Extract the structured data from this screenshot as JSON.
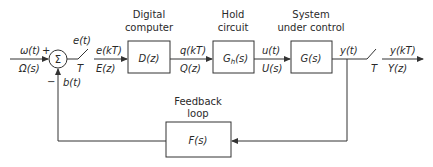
{
  "diagram": {
    "type": "block-diagram",
    "input": {
      "time": "ω(t)",
      "laplace": "Ω(s)",
      "sign": "+"
    },
    "summing_junction": {
      "symbol": "Σ",
      "feedback_sign": "−"
    },
    "sampler_in": {
      "signal_above": "e(t)",
      "period": "T",
      "out_time": "e(kT)",
      "out_z": "E(z)"
    },
    "blocks": [
      {
        "id": "digital-computer",
        "caption_line1": "Digital",
        "caption_line2": "computer",
        "tf": "D(z)"
      },
      {
        "id": "hold-circuit",
        "caption_line1": "Hold",
        "caption_line2": "circuit",
        "tf": "Gh(s)",
        "tf_main": "G",
        "tf_sub": "h",
        "tf_arg": "(s)"
      },
      {
        "id": "system-under-control",
        "caption_line1": "System",
        "caption_line2": "under control",
        "tf": "G(s)"
      },
      {
        "id": "feedback-loop",
        "caption_line1": "Feedback",
        "caption_line2": "loop",
        "tf": "F(s)"
      }
    ],
    "signals": {
      "q_time": "q(kT)",
      "q_z": "Q(z)",
      "u_time": "u(t)",
      "u_s": "U(s)",
      "y_time": "y(t)",
      "b_time": "b(t)"
    },
    "sampler_out": {
      "period": "T",
      "out_time": "y(kT)",
      "out_z": "Y(z)"
    }
  }
}
